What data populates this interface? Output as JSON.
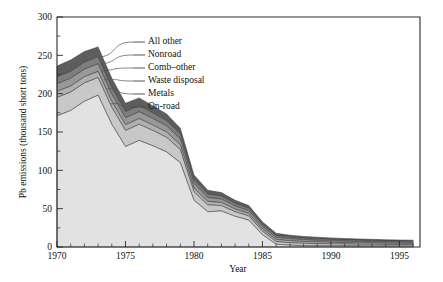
{
  "chart_data": {
    "type": "area",
    "title": "",
    "xlabel": "Year",
    "ylabel": "Pb emissions (thousand short tons)",
    "xlim": [
      1970,
      1996.5
    ],
    "ylim": [
      0,
      300
    ],
    "ytick_step": 50,
    "yticks": [
      0,
      50,
      100,
      150,
      200,
      250,
      300
    ],
    "ytick_labels": [
      "0",
      "50",
      "100",
      "150",
      "200",
      "250",
      "300"
    ],
    "xticks": [
      1970,
      1975,
      1980,
      1985,
      1990,
      1995
    ],
    "xtick_labels": [
      "1970",
      "1975",
      "1980",
      "1985",
      "1990",
      "1995"
    ],
    "xtick_minor_step": 1,
    "grid": false,
    "stacked": true,
    "legend_position": "inside-upper-right-with-leader-lines",
    "x": [
      1970,
      1971,
      1972,
      1973,
      1974,
      1975,
      1976,
      1977,
      1978,
      1979,
      1980,
      1981,
      1982,
      1983,
      1984,
      1985,
      1986,
      1987,
      1988,
      1989,
      1990,
      1991,
      1992,
      1993,
      1994,
      1995,
      1996
    ],
    "series": [
      {
        "name": "On-road",
        "color": "#e2e2e2",
        "values": [
          171,
          178,
          190,
          198,
          160,
          131,
          139,
          132,
          124,
          110,
          61,
          46,
          47,
          40,
          35,
          16,
          3.5,
          2.4,
          1.8,
          1.6,
          1.5,
          1.4,
          1.3,
          1.3,
          1.2,
          1.2,
          1.2
        ]
      },
      {
        "name": "Metals",
        "color": "#c8c8c8",
        "values": [
          24,
          24,
          24,
          23,
          22,
          21,
          21,
          20,
          19,
          17,
          11,
          9,
          7,
          6,
          5.5,
          4.5,
          3.5,
          3.2,
          3.0,
          2.8,
          2.6,
          2.4,
          2.3,
          2.2,
          2.1,
          2.0,
          2.0
        ]
      },
      {
        "name": "Waste disposal",
        "color": "#b0b0b0",
        "values": [
          8,
          8,
          8,
          8,
          8,
          7.5,
          7.5,
          7,
          7,
          6.5,
          5,
          4.5,
          4,
          3.5,
          3.2,
          3.0,
          2.8,
          2.6,
          2.4,
          2.2,
          2.0,
          1.9,
          1.8,
          1.7,
          1.6,
          1.5,
          1.5
        ]
      },
      {
        "name": "Comb–other",
        "color": "#989898",
        "values": [
          10,
          10,
          10,
          10,
          9.5,
          9,
          9,
          8.5,
          8,
          7.5,
          6,
          5,
          4.5,
          4,
          3.6,
          3.2,
          2.8,
          2.5,
          2.3,
          2.1,
          1.9,
          1.8,
          1.7,
          1.6,
          1.5,
          1.5,
          1.4
        ]
      },
      {
        "name": "Nonroad",
        "color": "#7e7e7e",
        "values": [
          9,
          9,
          9,
          9,
          8.5,
          8,
          8,
          7.5,
          7,
          6.5,
          5,
          4.5,
          4,
          3.5,
          3.2,
          2.8,
          2.4,
          2.2,
          2.0,
          1.9,
          1.8,
          1.7,
          1.6,
          1.5,
          1.4,
          1.4,
          1.3
        ]
      },
      {
        "name": "All other",
        "color": "#5d5d5d",
        "values": [
          14,
          15,
          14,
          13,
          12,
          11,
          10,
          9,
          8.5,
          7.5,
          6,
          5,
          4.5,
          4,
          3.6,
          3.2,
          2.8,
          2.5,
          2.3,
          2.1,
          2.0,
          1.9,
          1.8,
          1.7,
          1.6,
          1.5,
          1.5
        ]
      }
    ],
    "totals": [
      236,
      244,
      255,
      261,
      220,
      187.5,
      194.5,
      184,
      173.5,
      155,
      94,
      74,
      71,
      61,
      54.1,
      32.7,
      17.8,
      15.4,
      13.8,
      12.7,
      11.8,
      11.1,
      10.5,
      10.0,
      9.4,
      9.1,
      8.9
    ],
    "legend": [
      {
        "label": "All other"
      },
      {
        "label": "Nonroad"
      },
      {
        "label": "Comb–other"
      },
      {
        "label": "Waste disposal"
      },
      {
        "label": "Metals"
      },
      {
        "label": "On-road"
      }
    ]
  }
}
